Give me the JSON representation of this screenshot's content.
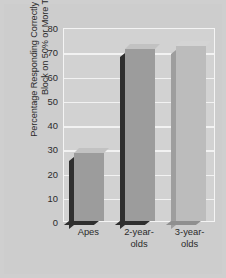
{
  "chart_data": {
    "type": "bar",
    "title": "",
    "xlabel": "",
    "ylabel": "Percentage Responding Correctly to the Wooden Block on 50% or More Trials",
    "categories": [
      "Apes",
      "2-year-\nolds",
      "3-year-\nolds"
    ],
    "values": [
      28,
      71,
      72
    ],
    "ylim": [
      0,
      80
    ],
    "yticks": [
      0,
      10,
      20,
      30,
      40,
      50,
      60,
      70,
      80
    ],
    "ytick_labels": [
      "0",
      "10",
      "20",
      "30",
      "40",
      "50",
      "60",
      "70",
      "80"
    ],
    "grid": true,
    "legend": "none",
    "series": [
      {
        "name": "Percentage responding correctly",
        "values": [
          28,
          71,
          72
        ]
      }
    ],
    "bar_styles": [
      "dark",
      "dark",
      "light"
    ],
    "colors": {
      "figure_background": "#cfcfcf",
      "plot_background": "#d2d2d2",
      "gridline": "#f2f2f2",
      "frame": "#f4f4f4",
      "bar_face_dark": "#9c9c9c",
      "bar_face_light": "#bcbcbc",
      "bar_shadow": "#2f2f2f",
      "bar_top": "#c2c2c2",
      "bar_backpanel": "#dcdcdc",
      "text": "#2b2b2b"
    }
  }
}
